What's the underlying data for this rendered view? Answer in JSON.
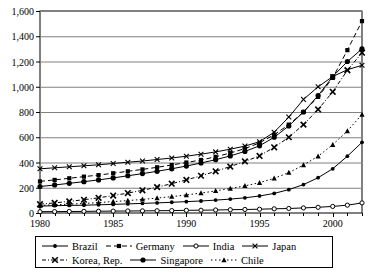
{
  "chart_data": {
    "type": "line",
    "title": "",
    "xlabel": "",
    "ylabel": "",
    "xlim": [
      1980,
      2002
    ],
    "ylim": [
      0,
      1600
    ],
    "ytick_step": 200,
    "grid": "horizontal",
    "legend_position": "bottom",
    "ytick_labels": [
      "0",
      "200",
      "400",
      "600",
      "800",
      "1,000",
      "1,200",
      "1,400",
      "1,600"
    ],
    "ytick_values": [
      0,
      200,
      400,
      600,
      800,
      1000,
      1200,
      1400,
      1600
    ],
    "xtick_labels": [
      "1980",
      "1985",
      "1990",
      "1995",
      "2000"
    ],
    "xtick_values": [
      1980,
      1985,
      1990,
      1995,
      2000
    ],
    "x": [
      1980,
      1981,
      1982,
      1983,
      1984,
      1985,
      1986,
      1987,
      1988,
      1989,
      1990,
      1991,
      1992,
      1993,
      1994,
      1995,
      1996,
      1997,
      1998,
      1999,
      2000,
      2001,
      2002
    ],
    "series": [
      {
        "name": "Brazil",
        "marker": "circle-small-filled",
        "dash": "solid",
        "values": [
          55,
          58,
          60,
          62,
          65,
          68,
          72,
          76,
          80,
          85,
          90,
          95,
          102,
          110,
          120,
          135,
          155,
          185,
          225,
          280,
          350,
          450,
          560
        ]
      },
      {
        "name": "Germany",
        "marker": "square",
        "dash": "dashed",
        "values": [
          250,
          262,
          275,
          288,
          300,
          315,
          330,
          345,
          362,
          380,
          400,
          420,
          445,
          475,
          510,
          555,
          620,
          700,
          800,
          920,
          1070,
          1290,
          1520
        ]
      },
      {
        "name": "India",
        "marker": "circle-open",
        "dash": "solid",
        "values": [
          10,
          11,
          12,
          13,
          14,
          15,
          16,
          17,
          18,
          19,
          21,
          22,
          24,
          26,
          28,
          30,
          33,
          36,
          40,
          45,
          52,
          62,
          80
        ]
      },
      {
        "name": "Japan",
        "marker": "x",
        "dash": "solid",
        "values": [
          350,
          358,
          366,
          374,
          382,
          392,
          402,
          412,
          424,
          436,
          450,
          466,
          484,
          505,
          530,
          565,
          640,
          760,
          900,
          1000,
          1080,
          1135,
          1170
        ]
      },
      {
        "name": "Korea, Rep.",
        "marker": "x-bold",
        "dash": "dash-dot",
        "values": [
          70,
          80,
          92,
          105,
          120,
          138,
          158,
          180,
          205,
          232,
          262,
          295,
          330,
          368,
          408,
          452,
          520,
          600,
          700,
          820,
          960,
          1130,
          1270
        ]
      },
      {
        "name": "Singapore",
        "marker": "circle-filled",
        "dash": "solid",
        "values": [
          210,
          222,
          235,
          248,
          262,
          278,
          295,
          312,
          330,
          350,
          372,
          396,
          422,
          452,
          488,
          532,
          600,
          690,
          800,
          930,
          1080,
          1200,
          1300
        ]
      },
      {
        "name": "Chile",
        "marker": "triangle",
        "dash": "dotted",
        "values": [
          60,
          65,
          70,
          76,
          82,
          90,
          98,
          108,
          118,
          130,
          143,
          158,
          175,
          194,
          215,
          240,
          275,
          320,
          380,
          450,
          540,
          650,
          780
        ]
      }
    ]
  },
  "legend": {
    "rows": [
      [
        {
          "label": "Brazil"
        },
        {
          "label": "Germany"
        },
        {
          "label": "India"
        },
        {
          "label": "Japan"
        }
      ],
      [
        {
          "label": "Korea, Rep."
        },
        {
          "label": "Singapore"
        },
        {
          "label": "Chile"
        }
      ]
    ]
  }
}
